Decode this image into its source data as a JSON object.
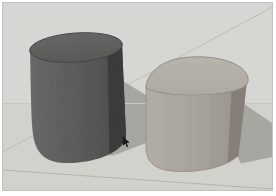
{
  "scene": {
    "type": "3d-modeling-viewport",
    "objects": [
      "dark-cylinder",
      "light-cylinder"
    ],
    "cursor_icon": "arrow-pointer"
  },
  "colors": {
    "frame": "#ffffff",
    "viewport_border": "#c1c1bd",
    "sky": "#d6d6d2",
    "ground": "#d2d2cc",
    "horizon_line": "#c7c7c3",
    "back_edge_line": "#bcbcb8",
    "front_edge_line": "#b3b3af",
    "shadow": "#a7a7a1",
    "dark_cylinder_top": "#6a6a68",
    "dark_cylinder_top_edge": "#454543",
    "dark_cylinder_front_left": "#6c6c6c",
    "dark_cylinder_front_right": "#575757",
    "dark_cylinder_side": "#3e3e3e",
    "light_cylinder_top": "#b8b4ac",
    "light_cylinder_top_edge": "#8b8780",
    "light_cylinder_front_left": "#b1ada5",
    "light_cylinder_front_mid": "#a9a59d",
    "light_cylinder_front_right": "#9b978f",
    "light_cylinder_side": "#857f78",
    "light_cylinder_bottom_edge": "#8f8b84",
    "cursor": "#1b1b1b"
  }
}
